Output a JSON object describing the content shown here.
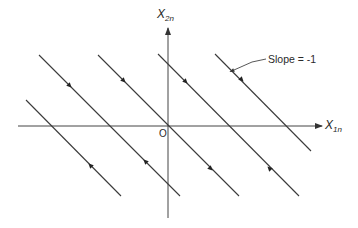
{
  "diagram": {
    "type": "phase-plane trajectories",
    "axes": {
      "x": {
        "label_main": "X",
        "label_sub": "1n"
      },
      "y": {
        "label_main": "X",
        "label_sub": "2n"
      },
      "origin_label": "O"
    },
    "annotation": {
      "text": "Slope = -1"
    },
    "colors": {
      "line": "#3a3a3a",
      "background": "#ffffff"
    },
    "trajectories": [
      {
        "id": "A",
        "x1": 26,
        "y1": 100,
        "x2": 121,
        "y2": 196,
        "arrow_at": [
          92,
          167
        ],
        "direction": "up-left"
      },
      {
        "id": "B",
        "x1": 39,
        "y1": 55,
        "x2": 180,
        "y2": 196,
        "arrow_at": [
          68,
          84
        ],
        "direction": "down-right",
        "arrow2_at": [
          147,
          163
        ],
        "direction2": "up-left"
      },
      {
        "id": "C",
        "x1": 98,
        "y1": 55,
        "x2": 239,
        "y2": 196,
        "arrow_at": [
          122,
          79
        ],
        "direction": "down-right",
        "arrow2_at": [
          209,
          167
        ],
        "direction2": "down-right"
      },
      {
        "id": "D",
        "x1": 158,
        "y1": 54,
        "x2": 299,
        "y2": 196,
        "arrow_at": [
          184,
          80
        ],
        "direction": "down-right",
        "arrow2_at": [
          271,
          170
        ],
        "direction2": "up-left"
      },
      {
        "id": "E",
        "x1": 215,
        "y1": 54,
        "x2": 311,
        "y2": 151,
        "arrow_at": [
          240,
          78
        ],
        "direction": "down-right"
      }
    ]
  }
}
